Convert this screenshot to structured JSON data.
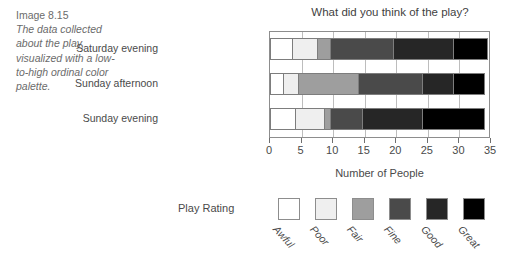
{
  "caption": {
    "id": "Image 8.15",
    "body": "The data collected about the play, visualized with a low-to-high ordinal color palette."
  },
  "chart_data": {
    "type": "bar",
    "orientation": "horizontal",
    "stacked": true,
    "title": "What did you think of the play?",
    "xlabel": "Number of People",
    "ylabel": "",
    "xlim": [
      0,
      35
    ],
    "xticks": [
      0,
      5,
      10,
      15,
      20,
      25,
      30,
      35
    ],
    "xtick_labels": [
      "0",
      "5",
      "10",
      "15",
      "20",
      "25",
      "30",
      "35"
    ],
    "grid": true,
    "legend_title": "Play Rating",
    "legend_position": "bottom",
    "categories": [
      "Saturday evening",
      "Sunday afternoon",
      "Sunday evening"
    ],
    "series": [
      {
        "name": "Awful",
        "color": "#ffffff",
        "values": [
          3.5,
          2,
          4
        ]
      },
      {
        "name": "Poor",
        "color": "#efefef",
        "values": [
          4,
          2.5,
          4.5
        ]
      },
      {
        "name": "Fair",
        "color": "#9e9e9e",
        "values": [
          2,
          9.5,
          1
        ]
      },
      {
        "name": "Fine",
        "color": "#4a4a4a",
        "values": [
          10,
          10,
          5
        ]
      },
      {
        "name": "Good",
        "color": "#262626",
        "values": [
          9.5,
          5,
          9.5
        ]
      },
      {
        "name": "Great",
        "color": "#000000",
        "values": [
          5.5,
          5,
          10
        ]
      }
    ],
    "totals": [
      34.5,
      34,
      34
    ]
  },
  "colors": {
    "frame": "#8d8d8d",
    "gridline": "#bdbdbd",
    "text": "#4a4a4a",
    "caption_text": "#6b6b6b"
  }
}
